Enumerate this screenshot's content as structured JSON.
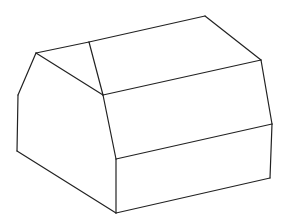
{
  "diagram": {
    "type": "isometric-line-drawing",
    "background": "#ffffff",
    "stroke_color": "#222222",
    "stroke_width": 1.2,
    "vertices": {
      "top_left": [
        36,
        53
      ],
      "ridge_front": [
        89,
        42
      ],
      "ridge_back": [
        205,
        16
      ],
      "right_top": [
        261,
        60
      ],
      "inner_front": [
        103,
        95
      ],
      "right_mid": [
        272,
        124
      ],
      "left_bend": [
        18,
        95
      ],
      "left_bottom": [
        17,
        151
      ],
      "front_mid": [
        116,
        159
      ],
      "front_bottom": [
        116,
        213
      ],
      "right_bottom": [
        270,
        178
      ]
    },
    "edges": [
      [
        "top_left",
        "ridge_front"
      ],
      [
        "ridge_front",
        "ridge_back"
      ],
      [
        "ridge_back",
        "right_top"
      ],
      [
        "top_left",
        "inner_front"
      ],
      [
        "ridge_front",
        "inner_front"
      ],
      [
        "inner_front",
        "right_top"
      ],
      [
        "top_left",
        "left_bend"
      ],
      [
        "left_bend",
        "left_bottom"
      ],
      [
        "left_bottom",
        "front_bottom"
      ],
      [
        "inner_front",
        "front_mid"
      ],
      [
        "front_mid",
        "right_mid"
      ],
      [
        "right_top",
        "right_mid"
      ],
      [
        "front_mid",
        "front_bottom"
      ],
      [
        "right_mid",
        "right_bottom"
      ],
      [
        "front_bottom",
        "right_bottom"
      ]
    ]
  }
}
